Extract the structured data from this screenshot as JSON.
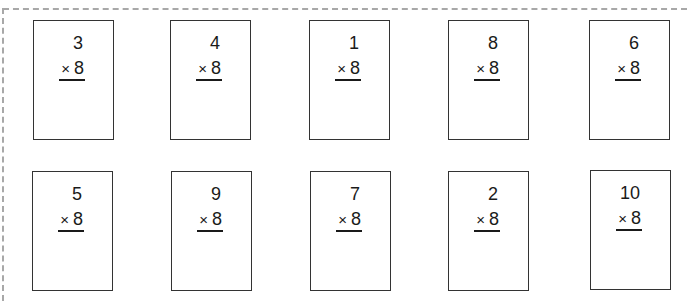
{
  "worksheet": {
    "multiplier": "8",
    "operator": "×",
    "problems": [
      {
        "top": "3",
        "multiplier": "8"
      },
      {
        "top": "4",
        "multiplier": "8"
      },
      {
        "top": "1",
        "multiplier": "8"
      },
      {
        "top": "8",
        "multiplier": "8"
      },
      {
        "top": "6",
        "multiplier": "8"
      },
      {
        "top": "5",
        "multiplier": "8"
      },
      {
        "top": "9",
        "multiplier": "8"
      },
      {
        "top": "7",
        "multiplier": "8"
      },
      {
        "top": "2",
        "multiplier": "8"
      },
      {
        "top": "10",
        "multiplier": "8"
      }
    ]
  },
  "colors": {
    "cut_line": "#a8a8a8",
    "card_border": "#333333",
    "text": "#1a1a1a"
  }
}
